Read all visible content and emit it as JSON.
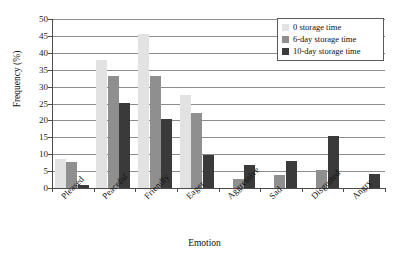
{
  "chart_data": {
    "type": "bar",
    "title": "",
    "xlabel": "Emotion",
    "ylabel": "Frequency (%)",
    "ylim": [
      0,
      50
    ],
    "ytick_step": 5,
    "yticks": [
      0,
      5,
      10,
      15,
      20,
      25,
      30,
      35,
      40,
      45,
      50
    ],
    "grid": true,
    "grid_axis": "y",
    "legend_position": "top-right",
    "categories": [
      "Pleased",
      "Peaceful",
      "Friendly",
      "Eager",
      "Aggressive",
      "Sad",
      "Disgusted",
      "Angry"
    ],
    "series": [
      {
        "name": "0 storage time",
        "color": "#e2e2e2",
        "values": [
          8.5,
          38.0,
          45.5,
          27.5,
          0,
          0,
          0,
          0
        ]
      },
      {
        "name": "6-day storage time",
        "color": "#8f8f8f",
        "values": [
          7.6,
          33.0,
          33.0,
          22.1,
          2.8,
          3.8,
          5.2,
          0
        ]
      },
      {
        "name": "10-day storage time",
        "color": "#3a3a3a",
        "values": [
          1.0,
          25.2,
          20.3,
          9.8,
          6.8,
          8.0,
          15.4,
          4.1
        ]
      }
    ]
  }
}
